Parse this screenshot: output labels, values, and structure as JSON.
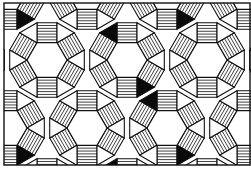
{
  "figure": {
    "tile_types": [
      {
        "name": "hexagon",
        "fill": "blank"
      },
      {
        "name": "square",
        "fill": "hatched"
      },
      {
        "name": "triangle",
        "fill": "solid-or-blank"
      }
    ]
  },
  "colors": {
    "ink": "#111111",
    "paper": "#ffffff",
    "solid": "#0a0a0a"
  }
}
